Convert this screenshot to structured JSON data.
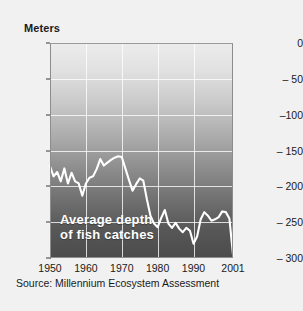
{
  "figure": {
    "y_axis_title": "Meters",
    "source_note": "Source: Millennium Ecosystem Assessment",
    "annotation_line1": "Average depth",
    "annotation_line2": "of fish catches",
    "background_color": "#f1f1f1",
    "line_color": "#ffffff",
    "gradient_top_color": "#ececec",
    "gradient_bottom_color": "#4b4b4b"
  },
  "chart_data": {
    "type": "line",
    "title": "Average depth of fish catches",
    "xlabel": "",
    "ylabel": "Meters",
    "xlim": [
      1950,
      2001
    ],
    "ylim": [
      -300,
      0
    ],
    "xticks": [
      1950,
      1960,
      1970,
      1980,
      1990,
      2001
    ],
    "xticklabels": [
      "1950",
      "1960",
      "1970",
      "1980",
      "1990",
      "2001"
    ],
    "yticks": [
      0,
      -50,
      -100,
      -150,
      -200,
      -250,
      -300
    ],
    "yticklabels": [
      "0",
      "– 50",
      "–100",
      "– 150",
      "– 200",
      "– 250",
      "– 300"
    ],
    "grid": true,
    "gridlines_x": [
      1960,
      1970,
      1980,
      1990
    ],
    "gridlines_y": [
      -50,
      -100,
      -150,
      -200,
      -250
    ],
    "legend": null,
    "annotations": [
      {
        "text": "Average depth of fish catches",
        "x": 1953,
        "y": -265
      }
    ],
    "series": [
      {
        "name": "Average depth of fish catches",
        "x": [
          1950,
          1951,
          1952,
          1953,
          1954,
          1955,
          1956,
          1957,
          1958,
          1959,
          1960,
          1961,
          1962,
          1963,
          1964,
          1965,
          1966,
          1967,
          1968,
          1969,
          1970,
          1971,
          1972,
          1973,
          1974,
          1975,
          1976,
          1977,
          1978,
          1979,
          1980,
          1981,
          1982,
          1983,
          1984,
          1985,
          1986,
          1987,
          1988,
          1989,
          1990,
          1991,
          1992,
          1993,
          1994,
          1995,
          1996,
          1997,
          1998,
          1999,
          2000,
          2001
        ],
        "values": [
          -172,
          -186,
          -180,
          -193,
          -175,
          -196,
          -181,
          -193,
          -196,
          -213,
          -196,
          -188,
          -186,
          -176,
          -162,
          -171,
          -167,
          -163,
          -160,
          -158,
          -159,
          -175,
          -191,
          -206,
          -197,
          -189,
          -192,
          -218,
          -241,
          -252,
          -257,
          -244,
          -233,
          -252,
          -258,
          -251,
          -259,
          -264,
          -258,
          -262,
          -280,
          -270,
          -246,
          -236,
          -241,
          -248,
          -246,
          -243,
          -235,
          -236,
          -245,
          -295
        ]
      }
    ]
  }
}
